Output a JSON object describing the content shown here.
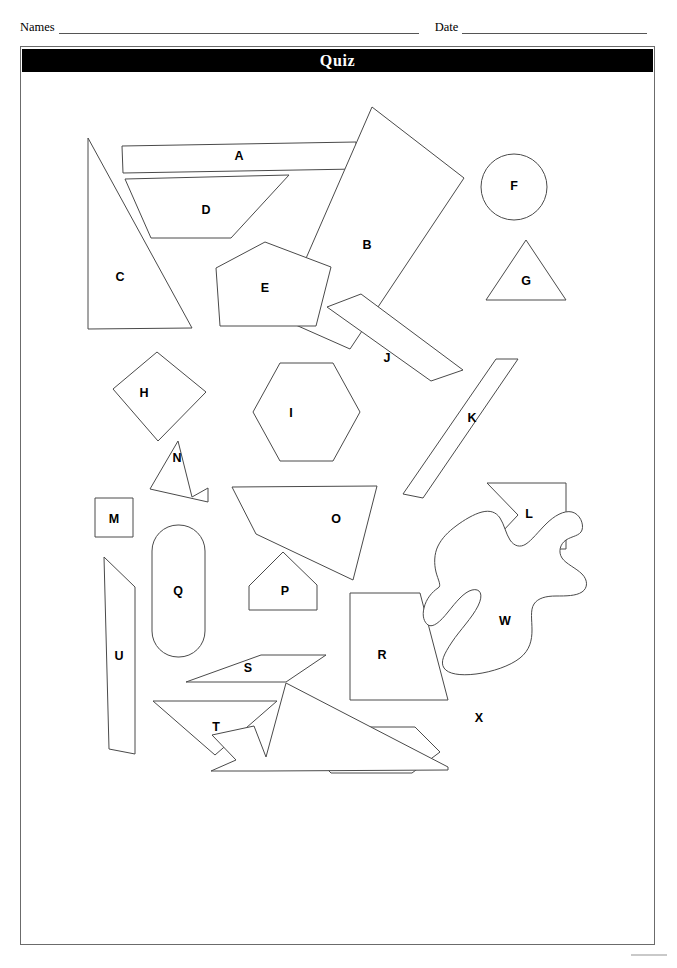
{
  "header": {
    "names_label": "Names",
    "date_label": "Date"
  },
  "title_bar": {
    "title": "Quiz"
  },
  "worksheet": {
    "shapes": [
      {
        "id": "A",
        "label": "A",
        "name": "shape-a-rectangle",
        "kind": "rectangle",
        "points": "102,72 336,68 337,95 103,99",
        "label_x": 219,
        "label_y": 83
      },
      {
        "id": "B",
        "label": "B",
        "name": "shape-b-quadrilateral",
        "kind": "quadrilateral",
        "points": "444,104 352,33 260,244 330,275",
        "label_x": 347,
        "label_y": 172
      },
      {
        "id": "C",
        "label": "C",
        "name": "shape-c-right-triangle",
        "kind": "triangle",
        "points": "68,64 68,255 172,254",
        "label_x": 100,
        "label_y": 204
      },
      {
        "id": "D",
        "label": "D",
        "name": "shape-d-trapezoid",
        "kind": "trapezoid",
        "points": "105,105 269,101 211,164 131,164",
        "label_x": 186,
        "label_y": 137
      },
      {
        "id": "E",
        "label": "E",
        "name": "shape-e-pentagon",
        "kind": "pentagon",
        "points": "245,168 311,193 296,252 200,252 196,194",
        "label_x": 245,
        "label_y": 215
      },
      {
        "id": "F",
        "label": "F",
        "name": "shape-f-circle",
        "kind": "circle",
        "cx": 494,
        "cy": 113,
        "r": 33,
        "label_x": 494,
        "label_y": 113
      },
      {
        "id": "G",
        "label": "G",
        "name": "shape-g-triangle",
        "kind": "triangle",
        "points": "506,166 546,226 466,226",
        "label_x": 506,
        "label_y": 208
      },
      {
        "id": "H",
        "label": "H",
        "name": "shape-h-rotated-square",
        "kind": "quadrilateral",
        "points": "137,278 186,318 138,367 93,315",
        "label_x": 124,
        "label_y": 320
      },
      {
        "id": "I",
        "label": "I",
        "name": "shape-i-hexagon",
        "kind": "hexagon",
        "points": "260,289 313,289 340,338 313,387 260,387 233,338",
        "label_x": 271,
        "label_y": 340
      },
      {
        "id": "J",
        "label": "J",
        "name": "shape-j-rotated-rectangle",
        "kind": "rectangle",
        "points": "341,220 443,296 411,307 307,233",
        "label_x": 367,
        "label_y": 285
      },
      {
        "id": "K",
        "label": "K",
        "name": "shape-k-slanted-quadrilateral",
        "kind": "quadrilateral",
        "points": "498,285 476,285 383,420 403,424",
        "label_x": 452,
        "label_y": 345
      },
      {
        "id": "L",
        "label": "L",
        "name": "shape-l-notched-arrow",
        "kind": "concave",
        "points": "467,409 498,441 466,475 546,475 546,409",
        "label_x": 509,
        "label_y": 441
      },
      {
        "id": "M",
        "label": "M",
        "name": "shape-m-square",
        "kind": "square",
        "points": "75,424 113,424 113,463 75,463",
        "label_x": 94,
        "label_y": 446
      },
      {
        "id": "N",
        "label": "N",
        "name": "shape-n-star-arrow",
        "kind": "concave",
        "points": "158,367 172,423 188,414 188,428 130,415",
        "label_x": 157,
        "label_y": 385
      },
      {
        "id": "O",
        "label": "O",
        "name": "shape-o-notched-quadrilateral",
        "kind": "concave",
        "points": "212,413 357,412 333,506 236,460",
        "label_x": 316,
        "label_y": 446
      },
      {
        "id": "P",
        "label": "P",
        "name": "shape-p-home-pentagon",
        "kind": "pentagon",
        "points": "263,478 297,511 297,536 229,536 229,512",
        "label_x": 265,
        "label_y": 518
      },
      {
        "id": "Q",
        "label": "Q",
        "name": "shape-q-stadium",
        "kind": "stadium",
        "x": 132,
        "y": 451,
        "w": 53,
        "h": 132,
        "rx": 26,
        "label_x": 158,
        "label_y": 518
      },
      {
        "id": "R",
        "label": "R",
        "name": "shape-r-trapezoid",
        "kind": "trapezoid",
        "points": "330,519 400,519 428,626 330,626",
        "label_x": 362,
        "label_y": 582
      },
      {
        "id": "S",
        "label": "S",
        "name": "shape-s-parallelogram",
        "kind": "parallelogram",
        "points": "241,581 306,581 266,608 166,608",
        "label_x": 228,
        "label_y": 595
      },
      {
        "id": "T",
        "label": "T",
        "name": "shape-t-triangle",
        "kind": "triangle",
        "points": "133,627 257,627 195,681",
        "label_x": 196,
        "label_y": 654
      },
      {
        "id": "U",
        "label": "U",
        "name": "shape-u-tall-quadrilateral",
        "kind": "quadrilateral",
        "points": "84,483 115,513 115,680 89,675",
        "label_x": 99,
        "label_y": 583
      },
      {
        "id": "V",
        "label": "V",
        "name": "shape-v-hexagon",
        "kind": "hexagon",
        "points": "319,653 395,653 420,678 392,699 311,699 287,675",
        "label_x": 339,
        "label_y": 676
      },
      {
        "id": "W",
        "label": "W",
        "name": "shape-w-irregular-blob",
        "kind": "blob",
        "path": "M 418,514 C 412,518 406,525 404,534 C 402,542 404,548 408,551 C 413,554 420,548 428,538 C 436,528 444,518 452,516 C 460,514 464,520 458,532 C 452,544 440,556 432,568 C 424,580 420,588 424,594 C 428,600 440,602 456,600 C 472,598 490,592 500,584 C 510,576 512,566 512,556 C 512,546 510,536 514,530 C 518,524 526,522 536,522 C 546,522 556,522 562,518 C 568,514 568,506 562,500 C 556,494 546,490 542,484 C 538,478 540,470 546,466 C 552,462 560,462 562,456 C 564,450 560,440 552,438 C 544,436 534,442 526,450 C 518,458 512,466 506,470 C 500,474 494,472 490,466 C 486,460 484,450 480,444 C 476,438 470,436 462,438 C 454,440 444,446 436,452 C 428,458 422,464 418,472 C 414,480 414,490 416,498 C 418,506 422,512 418,514 Z",
        "label_x": 485,
        "label_y": 548
      },
      {
        "id": "X",
        "label": "X",
        "name": "shape-x-zigzag",
        "kind": "concave",
        "points": "266,609 246,683 234,652 192,661 216,686 191,697 244,697 428,696 428,693",
        "label_x": 459,
        "label_y": 645
      }
    ]
  }
}
